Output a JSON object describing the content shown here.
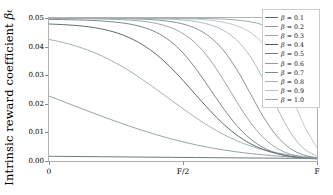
{
  "chart_data": {
    "type": "line",
    "title": "",
    "xlabel": "",
    "ylabel": "Intrinsic reward coefficient βt",
    "ylabel_main": "Intrinsic reward coefficient",
    "ylabel_symbol": "β",
    "ylabel_subscript": "t",
    "xlim": [
      0,
      1
    ],
    "ylim": [
      0.0,
      0.05
    ],
    "grid": false,
    "legend_position": "upper right",
    "legend_title": "",
    "x_tick_labels": [
      "0",
      "F/2",
      "F"
    ],
    "x_tick_positions": [
      0.0,
      0.5,
      1.0
    ],
    "y_tick_labels": [
      "0.00",
      "0.01",
      "0.02",
      "0.03",
      "0.04",
      "0.05"
    ],
    "y_tick_positions": [
      0.0,
      0.01,
      0.02,
      0.03,
      0.04,
      0.05
    ],
    "x": [
      0.0,
      0.05,
      0.1,
      0.15,
      0.2,
      0.25,
      0.3,
      0.35,
      0.4,
      0.45,
      0.5,
      0.55,
      0.6,
      0.65,
      0.7,
      0.75,
      0.8,
      0.85,
      0.9,
      0.95,
      1.0
    ],
    "series": [
      {
        "name": "B = 0.1",
        "label": "β = 0.1",
        "beta": 0.1,
        "color": "#5a6b70",
        "values": [
          0.00165,
          0.00161,
          0.00157,
          0.00153,
          0.00149,
          0.00145,
          0.00141,
          0.00137,
          0.00133,
          0.00129,
          0.00125,
          0.00121,
          0.00117,
          0.00113,
          0.0011,
          0.00106,
          0.00103,
          0.001,
          0.00097,
          0.00094,
          0.00091
        ]
      },
      {
        "name": "B = 0.2",
        "label": "β = 0.2",
        "beta": 0.2,
        "color": "#8b9ba0",
        "values": [
          0.0227,
          0.0209,
          0.0191,
          0.0173,
          0.01555,
          0.01385,
          0.0122,
          0.01065,
          0.0092,
          0.00788,
          0.00668,
          0.00562,
          0.00468,
          0.00388,
          0.00319,
          0.00262,
          0.00214,
          0.00175,
          0.00143,
          0.00117,
          0.00098
        ]
      },
      {
        "name": "B = 0.3",
        "label": "β = 0.3",
        "beta": 0.3,
        "color": "#9aa8ad",
        "values": [
          0.0425,
          0.0415,
          0.0402,
          0.0386,
          0.0366,
          0.0342,
          0.0315,
          0.0284,
          0.0251,
          0.0217,
          0.0183,
          0.015,
          0.012,
          0.00935,
          0.00712,
          0.00532,
          0.00392,
          0.00288,
          0.00212,
          0.00158,
          0.0012
        ]
      },
      {
        "name": "B = 0.4",
        "label": "β = 0.4",
        "beta": 0.4,
        "color": "#4c5a60",
        "values": [
          0.0479,
          0.0477,
          0.0474,
          0.0469,
          0.0461,
          0.0449,
          0.0431,
          0.0406,
          0.0373,
          0.0331,
          0.0282,
          0.0229,
          0.0177,
          0.013,
          0.0091,
          0.00612,
          0.004,
          0.00258,
          0.00168,
          0.00115,
          0.0009
        ]
      },
      {
        "name": "B = 0.5",
        "label": "β = 0.5",
        "beta": 0.5,
        "color": "#6d7c82",
        "values": [
          0.0495,
          0.04945,
          0.04935,
          0.0492,
          0.04895,
          0.04855,
          0.0479,
          0.0468,
          0.045,
          0.0421,
          0.0378,
          0.032,
          0.0253,
          0.0185,
          0.0125,
          0.00785,
          0.00465,
          0.00268,
          0.00156,
          0.00098,
          0.00072
        ]
      },
      {
        "name": "B = 0.6",
        "label": "β = 0.6",
        "beta": 0.6,
        "color": "#8e9ea3",
        "values": [
          0.04985,
          0.04983,
          0.0498,
          0.04975,
          0.04966,
          0.04952,
          0.04928,
          0.04886,
          0.04812,
          0.0468,
          0.04455,
          0.0409,
          0.0355,
          0.0285,
          0.0208,
          0.0137,
          0.00815,
          0.0045,
          0.0024,
          0.00128,
          0.0008
        ]
      },
      {
        "name": "B = 0.7",
        "label": "β = 0.7",
        "beta": 0.7,
        "color": "#7a8a90",
        "values": [
          0.04995,
          0.04994,
          0.04993,
          0.04991,
          0.04988,
          0.04983,
          0.04975,
          0.0496,
          0.04932,
          0.04882,
          0.0479,
          0.04625,
          0.0434,
          0.0388,
          0.0321,
          0.0238,
          0.0154,
          0.0087,
          0.0044,
          0.0021,
          0.00105
        ]
      },
      {
        "name": "B = 0.8",
        "label": "β = 0.8",
        "beta": 0.8,
        "color": "#a6b4b8",
        "values": [
          0.04998,
          0.04998,
          0.04997,
          0.04997,
          0.04996,
          0.04994,
          0.04991,
          0.04986,
          0.04977,
          0.0496,
          0.0493,
          0.04872,
          0.04765,
          0.0457,
          0.0423,
          0.0367,
          0.0285,
          0.0188,
          0.0101,
          0.0044,
          0.00175
        ]
      },
      {
        "name": "B = 0.9",
        "label": "β = 0.9",
        "beta": 0.9,
        "color": "#b7c3c6",
        "values": [
          0.04999,
          0.04999,
          0.04999,
          0.04999,
          0.04998,
          0.04998,
          0.04997,
          0.04995,
          0.04992,
          0.04987,
          0.04977,
          0.04958,
          0.04923,
          0.04856,
          0.0473,
          0.045,
          0.0409,
          0.034,
          0.024,
          0.0128,
          0.0047
        ]
      },
      {
        "name": "B = 1.0",
        "label": "β = 1.0",
        "beta": 1.0,
        "color": "#93a2a7",
        "values": [
          0.05,
          0.05,
          0.05,
          0.05,
          0.04999,
          0.04999,
          0.04999,
          0.04998,
          0.04997,
          0.04996,
          0.04993,
          0.04988,
          0.04979,
          0.04962,
          0.0493,
          0.0487,
          0.04755,
          0.0454,
          0.0414,
          0.0343,
          0.0232
        ]
      }
    ]
  },
  "axes": {
    "frame_color": "#b0b0b0",
    "tick_color": "#8a8a8a",
    "background": "#ffffff"
  }
}
